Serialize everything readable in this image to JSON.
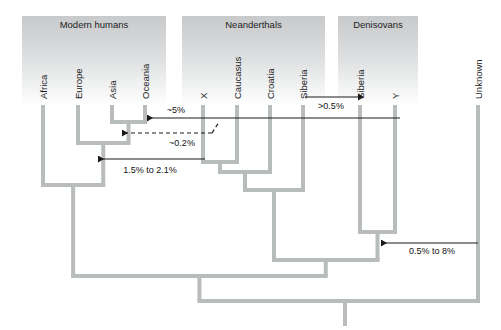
{
  "figure": {
    "type": "phylogenetic-admixture-diagram",
    "groups": [
      {
        "id": "modern-humans",
        "label": "Modern humans",
        "x0": 22,
        "x1": 166,
        "y0": 16,
        "y1": 105
      },
      {
        "id": "neanderthals",
        "label": "Neanderthals",
        "x0": 182,
        "x1": 325,
        "y0": 16,
        "y1": 105
      },
      {
        "id": "denisovans",
        "label": "Denisovans",
        "x0": 338,
        "x1": 418,
        "y0": 16,
        "y1": 105
      }
    ],
    "tips": [
      {
        "id": "africa",
        "label": "Africa",
        "x": 43,
        "group": "modern-humans"
      },
      {
        "id": "europe",
        "label": "Europe",
        "x": 78,
        "group": "modern-humans"
      },
      {
        "id": "asia",
        "label": "Asia",
        "x": 112,
        "group": "modern-humans"
      },
      {
        "id": "oceania",
        "label": "Oceania",
        "x": 145,
        "group": "modern-humans"
      },
      {
        "id": "neander-x",
        "label": "X",
        "x": 203,
        "group": "neanderthals"
      },
      {
        "id": "caucasus",
        "label": "Caucasus",
        "x": 237,
        "group": "neanderthals"
      },
      {
        "id": "croatia",
        "label": "Croatia",
        "x": 270,
        "group": "neanderthals"
      },
      {
        "id": "neander-siberia",
        "label": "Siberia",
        "x": 303,
        "group": "neanderthals"
      },
      {
        "id": "denis-siberia",
        "label": "Siberia",
        "x": 360,
        "group": "denisovans"
      },
      {
        "id": "denis-y",
        "label": "Y",
        "x": 395,
        "group": "denisovans"
      },
      {
        "id": "unknown",
        "label": "Unknown",
        "x": 478,
        "group": "none"
      }
    ],
    "gene_flow": [
      {
        "id": "flow-5",
        "label": "~5%",
        "from_x": 400,
        "to_x": 147,
        "y": 118,
        "style": "solid",
        "direction": "left",
        "label_x": 176,
        "label_y": 113
      },
      {
        "id": "flow-02",
        "label": "~0.2%",
        "from_x": 212,
        "to_x": 122,
        "y": 133,
        "style": "dashed",
        "direction": "left",
        "label_x": 182,
        "label_y": 146
      },
      {
        "id": "flow-15-21",
        "label": "1.5% to 2.1%",
        "from_x": 205,
        "to_x": 98,
        "y": 159,
        "style": "solid",
        "direction": "left",
        "label_x": 150,
        "label_y": 173
      },
      {
        "id": "flow-05",
        "label": ">0.5%",
        "from_x": 305,
        "to_x": 358,
        "y": 97,
        "style": "solid",
        "direction": "right",
        "label_x": 331,
        "label_y": 109
      },
      {
        "id": "flow-05-8",
        "label": "0.5% to 8%",
        "from_x": 478,
        "to_x": 381,
        "y": 243,
        "style": "solid",
        "direction": "left",
        "label_x": 432,
        "label_y": 254
      }
    ],
    "tree_nodes": [
      {
        "id": "asia-oceania",
        "y": 122,
        "children": [
          "asia",
          "oceania"
        ]
      },
      {
        "id": "eurasia",
        "y": 143,
        "children": [
          "europe",
          "asia-oceania"
        ]
      },
      {
        "id": "modern-human-root",
        "y": 185,
        "children": [
          "africa",
          "eurasia"
        ]
      },
      {
        "id": "x-caucasus",
        "y": 162,
        "children": [
          "neander-x",
          "caucasus"
        ]
      },
      {
        "id": "neander-croatia",
        "y": 172,
        "children": [
          "x-caucasus",
          "croatia"
        ]
      },
      {
        "id": "neanderthal-root",
        "y": 190,
        "children": [
          "neander-croatia",
          "neander-siberia"
        ]
      },
      {
        "id": "denisovan-root",
        "y": 232,
        "children": [
          "denis-siberia",
          "denis-y"
        ]
      },
      {
        "id": "archaic-root",
        "y": 260,
        "children": [
          "neanderthal-root",
          "denisovan-root"
        ]
      },
      {
        "id": "human-archaic",
        "y": 276,
        "children": [
          "modern-human-root",
          "archaic-root"
        ]
      },
      {
        "id": "deep-root",
        "y": 301,
        "children": [
          "human-archaic",
          "unknown"
        ],
        "stem_x": 345,
        "stem_bottom": 326
      }
    ],
    "style": {
      "branch_color": "#b8bcbd",
      "branch_width": 4,
      "arrow_color": "#1a1a1a",
      "panel_top_gray": "#c9cbcb",
      "panel_bottom_gray": "#ffffff",
      "background": "#ffffff"
    }
  }
}
